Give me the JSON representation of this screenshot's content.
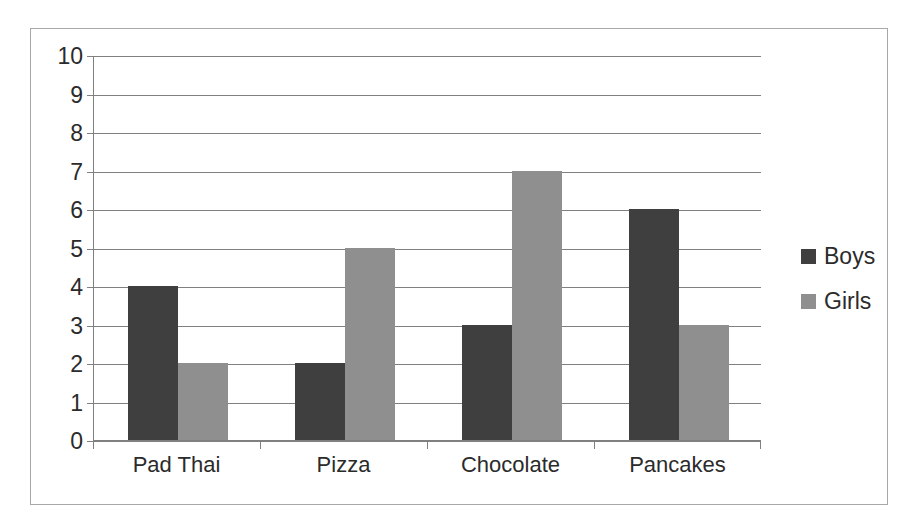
{
  "chart_data": {
    "type": "bar",
    "title": "",
    "subtitle": "",
    "xlabel": "",
    "ylabel": "",
    "categories": [
      "Pad Thai",
      "Pizza",
      "Chocolate",
      "Pancakes"
    ],
    "series": [
      {
        "name": "Boys",
        "values": [
          4,
          2,
          3,
          6
        ],
        "color": "#3f3f3f"
      },
      {
        "name": "Girls",
        "values": [
          2,
          5,
          7,
          3
        ],
        "color": "#8f8f8f"
      }
    ],
    "ylim": [
      0,
      10
    ],
    "y_ticks": [
      0,
      1,
      2,
      3,
      4,
      5,
      6,
      7,
      8,
      9,
      10
    ],
    "y_tick_labels": [
      "0",
      "1",
      "2",
      "3",
      "4",
      "5",
      "6",
      "7",
      "8",
      "9",
      "10"
    ],
    "grid": true,
    "grid_axis": "y",
    "legend_position": "right",
    "annotations": []
  },
  "style": {
    "plot_background": "#ffffff",
    "frame_border_color": "#a8a8a8",
    "gridline_color": "#808080",
    "axis_color": "#808080",
    "text_color": "#2b2b2b"
  }
}
